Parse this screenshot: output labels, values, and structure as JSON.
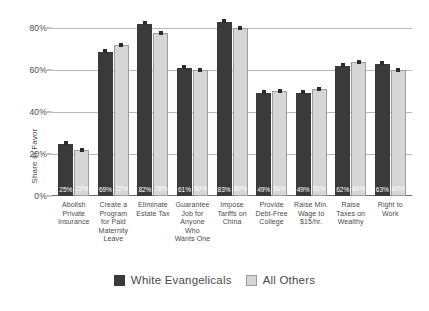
{
  "chart_data": {
    "type": "bar",
    "title": "",
    "xlabel": "",
    "ylabel": "Share in Favor",
    "ylim": [
      0,
      85
    ],
    "ytick_values": [
      0,
      20,
      40,
      60,
      80
    ],
    "ytick_labels": [
      "0%",
      "20%",
      "40%",
      "60%",
      "80%"
    ],
    "grid": true,
    "legend_position": "bottom-center",
    "categories": [
      "Abolish Private Insurance",
      "Create a Program for Paid Maternity Leave",
      "Eliminate Estate Tax",
      "Guarantee Job for Anyone Who Wants One",
      "Impose Tariffs on China",
      "Provide Debt-Free College",
      "Raise Min. Wage to $15/hr.",
      "Raise Taxes on Wealthy",
      "Right to Work"
    ],
    "series": [
      {
        "name": "White Evangelicals",
        "color": "#3a3a3a",
        "values": [
          25,
          69,
          82,
          61,
          83,
          49,
          49,
          62,
          63
        ],
        "value_labels": [
          "25%",
          "69%",
          "82%",
          "61%",
          "83%",
          "49%",
          "49%",
          "62%",
          "63%"
        ]
      },
      {
        "name": "All Others",
        "color": "#d6d6d6",
        "values": [
          22,
          72,
          78,
          60,
          80,
          50,
          51,
          64,
          60
        ],
        "value_labels": [
          "22%",
          "72%",
          "78%",
          "60%",
          "80%",
          "50%",
          "51%",
          "64%",
          "60%"
        ]
      }
    ]
  },
  "axis": {
    "category_lines": [
      [
        "Abolish",
        "Private",
        "Insurance"
      ],
      [
        "Create a",
        "Program",
        "for Paid",
        "Maternity",
        "Leave"
      ],
      [
        "Eliminate",
        "Estate Tax"
      ],
      [
        "Guarantee",
        "Job for",
        "Anyone Who",
        "Wants One"
      ],
      [
        "Impose",
        "Tariffs on",
        "China"
      ],
      [
        "Provide",
        "Debt-Free",
        "College"
      ],
      [
        "Raise Min.",
        "Wage to",
        "$15/hr."
      ],
      [
        "Raise",
        "Taxes on",
        "Wealthy"
      ],
      [
        "Right to",
        "Work"
      ]
    ]
  }
}
